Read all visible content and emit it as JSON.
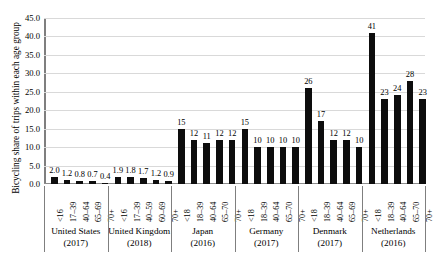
{
  "chart_data": {
    "type": "bar",
    "title": "",
    "xlabel": "",
    "ylabel": "Bicycling share of trips within each age group",
    "ylim": [
      0,
      45
    ],
    "ytick_step": 5,
    "grid": true,
    "legend": "none",
    "ytick_labels": [
      "0.0",
      "5.0",
      "10.0",
      "15.0",
      "20.0",
      "25.0",
      "30.0",
      "35.0",
      "40.0",
      "45.0"
    ],
    "groups": [
      {
        "country": "United States",
        "year": "(2017)",
        "categories": [
          "<16",
          "17–39",
          "40–64",
          "65–69",
          "70+"
        ],
        "values": [
          2.0,
          1.2,
          0.8,
          0.7,
          0.4
        ],
        "labels": [
          "2.0",
          "1.2",
          "0.8",
          "0.7",
          "0.4"
        ]
      },
      {
        "country": "United Kingdom",
        "year": "(2018)",
        "categories": [
          "<16",
          "17–39",
          "40–59",
          "60–69",
          "70+"
        ],
        "values": [
          1.9,
          1.8,
          1.7,
          1.2,
          0.9
        ],
        "labels": [
          "1.9",
          "1.8",
          "1.7",
          "1.2",
          "0.9"
        ]
      },
      {
        "country": "Japan",
        "year": "(2016)",
        "categories": [
          "<18",
          "18–39",
          "40–64",
          "65–70",
          "70+"
        ],
        "values": [
          15,
          12,
          11,
          12,
          12
        ],
        "labels": [
          "15",
          "12",
          "11",
          "12",
          "12"
        ]
      },
      {
        "country": "Germany",
        "year": "(2017)",
        "categories": [
          "<18",
          "18–39",
          "40–64",
          "65–70",
          "70+"
        ],
        "values": [
          15,
          10,
          10,
          10,
          10
        ],
        "labels": [
          "15",
          "10",
          "10",
          "10",
          "10"
        ]
      },
      {
        "country": "Denmark",
        "year": "(2017)",
        "categories": [
          "<18",
          "18–39",
          "40–64",
          "65–69",
          "70+"
        ],
        "values": [
          26,
          17,
          12,
          12,
          10
        ],
        "labels": [
          "26",
          "17",
          "12",
          "12",
          "10"
        ]
      },
      {
        "country": "Netherlands",
        "year": "(2016)",
        "categories": [
          "<18",
          "18–39",
          "40–64",
          "65–70",
          "70+"
        ],
        "values": [
          41,
          23,
          24,
          28,
          23
        ],
        "labels": [
          "41",
          "23",
          "24",
          "28",
          "23"
        ]
      }
    ],
    "colors": {
      "bar": "#0d0d0d",
      "grid": "#d9d9d9",
      "axis": "#7f7f7f",
      "text": "#000000",
      "background": "#ffffff"
    }
  }
}
